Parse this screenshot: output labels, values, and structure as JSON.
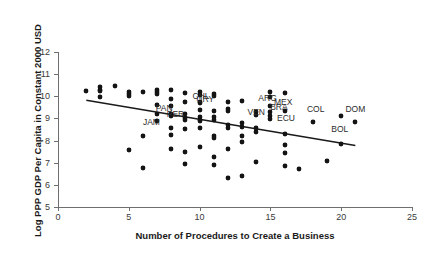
{
  "chart_data": {
    "type": "scatter",
    "title": "",
    "xlabel": "Number of Procedures to Create a Business",
    "ylabel": "Log PPP GDP Per Capita in Constant 2000 USD",
    "xlim": [
      0,
      25
    ],
    "ylim": [
      5,
      12
    ],
    "xticks": [
      0,
      5,
      10,
      15,
      20,
      25
    ],
    "yticks": [
      5,
      6,
      7,
      8,
      9,
      10,
      11,
      12
    ],
    "grid": false,
    "legend": "none",
    "marker": "diamond",
    "marker_color": "#141414",
    "trendline": {
      "visible": true,
      "color": "#1a1a1a",
      "x_start": 2,
      "y_start": 9.82,
      "x_end": 21,
      "y_end": 7.78,
      "slope": -0.1074,
      "intercept": 10.03
    },
    "points": [
      [
        2,
        10.22
      ],
      [
        3,
        10.42
      ],
      [
        3,
        10.3
      ],
      [
        3,
        10.22
      ],
      [
        3,
        9.95
      ],
      [
        4,
        10.48
      ],
      [
        5,
        10.2
      ],
      [
        5,
        10.12
      ],
      [
        5,
        10.0
      ],
      [
        5,
        7.57
      ],
      [
        6,
        10.2
      ],
      [
        6,
        8.2
      ],
      [
        6,
        6.76
      ],
      [
        7,
        10.28
      ],
      [
        7,
        10.18
      ],
      [
        7,
        10.1
      ],
      [
        7,
        9.6
      ],
      [
        7,
        9.22
      ],
      [
        7,
        8.88
      ],
      [
        8,
        10.28
      ],
      [
        8,
        9.88
      ],
      [
        8,
        9.55
      ],
      [
        8,
        9.18
      ],
      [
        8,
        9.12
      ],
      [
        8,
        8.55
      ],
      [
        8,
        8.27
      ],
      [
        8,
        7.63
      ],
      [
        9,
        10.15
      ],
      [
        9,
        9.72
      ],
      [
        9,
        9.22
      ],
      [
        9,
        9.0
      ],
      [
        9,
        8.95
      ],
      [
        9,
        8.52
      ],
      [
        9,
        7.5
      ],
      [
        9,
        6.95
      ],
      [
        10,
        10.18
      ],
      [
        10,
        10.08
      ],
      [
        10,
        9.72
      ],
      [
        10,
        9.7
      ],
      [
        10,
        9.38
      ],
      [
        10,
        9.08
      ],
      [
        10,
        8.95
      ],
      [
        10,
        8.9
      ],
      [
        10,
        8.55
      ],
      [
        10,
        7.7
      ],
      [
        11,
        10.12
      ],
      [
        11,
        10.0
      ],
      [
        11,
        9.35
      ],
      [
        11,
        9.05
      ],
      [
        11,
        8.95
      ],
      [
        11,
        8.2
      ],
      [
        11,
        8.12
      ],
      [
        11,
        7.28
      ],
      [
        11,
        6.9
      ],
      [
        12,
        9.75
      ],
      [
        12,
        9.42
      ],
      [
        12,
        9.35
      ],
      [
        12,
        8.72
      ],
      [
        12,
        8.58
      ],
      [
        12,
        7.62
      ],
      [
        12,
        6.33
      ],
      [
        13,
        9.8
      ],
      [
        13,
        8.78
      ],
      [
        13,
        8.6
      ],
      [
        13,
        8.22
      ],
      [
        13,
        7.95
      ],
      [
        13,
        6.42
      ],
      [
        14,
        9.3
      ],
      [
        14,
        9.15
      ],
      [
        14,
        8.58
      ],
      [
        14,
        8.4
      ],
      [
        14,
        7.02
      ],
      [
        15,
        10.18
      ],
      [
        15,
        9.98
      ],
      [
        15,
        9.55
      ],
      [
        15,
        9.3
      ],
      [
        15,
        9.1
      ],
      [
        15,
        8.98
      ],
      [
        16,
        10.15
      ],
      [
        16,
        9.35
      ],
      [
        16,
        8.28
      ],
      [
        16,
        7.82
      ],
      [
        16,
        7.42
      ],
      [
        16,
        6.87
      ],
      [
        17,
        6.7
      ],
      [
        18,
        8.82
      ],
      [
        19,
        7.08
      ],
      [
        20,
        9.12
      ],
      [
        20,
        7.85
      ],
      [
        21,
        8.85
      ]
    ],
    "annotations": [
      {
        "label": "JAM",
        "x": 6.6,
        "y": 8.86
      },
      {
        "label": "PAN",
        "x": 7.5,
        "y": 9.48
      },
      {
        "label": "PER",
        "x": 8.3,
        "y": 9.22
      },
      {
        "label": "CHL",
        "x": 10.1,
        "y": 10.02
      },
      {
        "label": "URY",
        "x": 10.4,
        "y": 9.86
      },
      {
        "label": "VEN",
        "x": 14.0,
        "y": 9.28
      },
      {
        "label": "ARG",
        "x": 14.8,
        "y": 9.92
      },
      {
        "label": "MEX",
        "x": 15.9,
        "y": 9.72
      },
      {
        "label": "BRA",
        "x": 15.6,
        "y": 9.52
      },
      {
        "label": "ECU",
        "x": 16.1,
        "y": 9.02
      },
      {
        "label": "COL",
        "x": 18.2,
        "y": 9.42
      },
      {
        "label": "BOL",
        "x": 19.9,
        "y": 8.52
      },
      {
        "label": "DOM",
        "x": 21.0,
        "y": 9.42
      }
    ]
  }
}
